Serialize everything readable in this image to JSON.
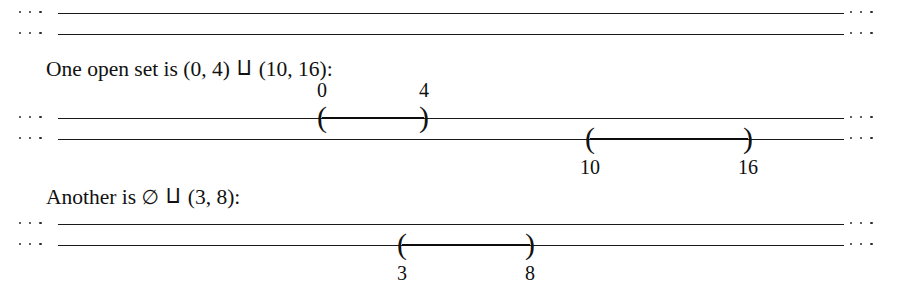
{
  "figure": {
    "ellipsis_dots": [
      "·",
      "·",
      "·"
    ],
    "line_color": "#1a1a1a",
    "interval_color": "#0d0d0d"
  },
  "groups": [
    {
      "id": "group-top",
      "caption": null,
      "lines": [
        {
          "id": "line-top-1",
          "intervals": []
        },
        {
          "id": "line-top-2",
          "intervals": []
        }
      ]
    },
    {
      "id": "group-middle",
      "caption": {
        "prefix": "One open set is",
        "first_interval": "(0, 4)",
        "coproduct_symbol": "⨿",
        "second_interval": "(10, 16)",
        "suffix": ":",
        "full_text": "One open set is (0, 4) ⨿ (10, 16):"
      },
      "lines": [
        {
          "id": "line-mid-1",
          "intervals": [
            {
              "id": "interval-0-4",
              "start_label": "0",
              "end_label": "4",
              "open_paren": "(",
              "close_paren": ")",
              "labels_position": "above"
            }
          ]
        },
        {
          "id": "line-mid-2",
          "intervals": [
            {
              "id": "interval-10-16",
              "start_label": "10",
              "end_label": "16",
              "open_paren": "(",
              "close_paren": ")",
              "labels_position": "below"
            }
          ]
        }
      ]
    },
    {
      "id": "group-bottom",
      "caption": {
        "prefix": "Another is",
        "first_interval": "∅",
        "coproduct_symbol": "⨿",
        "second_interval": "(3, 8)",
        "suffix": ":",
        "full_text": "Another is ∅ ⨿ (3, 8):"
      },
      "lines": [
        {
          "id": "line-bot-1",
          "intervals": []
        },
        {
          "id": "line-bot-2",
          "intervals": [
            {
              "id": "interval-3-8",
              "start_label": "3",
              "end_label": "8",
              "open_paren": "(",
              "close_paren": ")",
              "labels_position": "below"
            }
          ]
        }
      ]
    }
  ]
}
